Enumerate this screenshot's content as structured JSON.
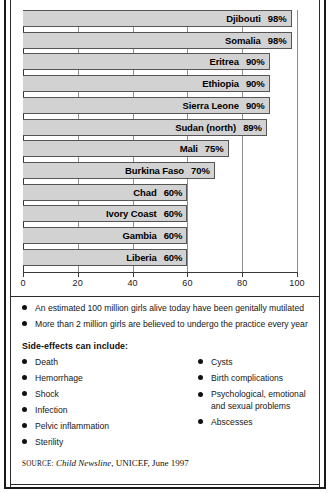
{
  "chart_data": {
    "type": "bar",
    "orientation": "horizontal",
    "title": "",
    "xlabel": "",
    "ylabel": "",
    "xlim": [
      0,
      100
    ],
    "grid": true,
    "value_suffix": "%",
    "tick_labels": [
      "0",
      "20",
      "40",
      "60",
      "80",
      "100"
    ],
    "tick_values": [
      0,
      20,
      40,
      60,
      80,
      100
    ],
    "categories": [
      "Djibouti",
      "Somalia",
      "Eritrea",
      "Ethiopia",
      "Sierra Leone",
      "Sudan (north)",
      "Mali",
      "Burkina Faso",
      "Chad",
      "Ivory Coast",
      "Gambia",
      "Liberia"
    ],
    "values": [
      98,
      98,
      90,
      90,
      90,
      89,
      75,
      70,
      60,
      60,
      60,
      60
    ],
    "value_labels": [
      "98%",
      "98%",
      "90%",
      "90%",
      "90%",
      "89%",
      "75%",
      "70%",
      "60%",
      "60%",
      "60%",
      "60%"
    ],
    "bar_fill": "#d2d2d2",
    "bar_border": "#555555"
  },
  "notes": [
    "An estimated 100 million girls alive today have been genitally mutilated",
    "More than 2 million girls are believed to undergo the practice every year"
  ],
  "side_effects": {
    "heading": "Side-effects can include:",
    "left": [
      "Death",
      "Hemorrhage",
      "Shock",
      "Infection",
      "Pelvic inflammation",
      "Sterility"
    ],
    "right": [
      "Cysts",
      "Birth complications",
      "Psychological, emotional",
      "Abscesses"
    ],
    "right_wrap_line": "and sexual problems"
  },
  "source": {
    "label": "SOURCE:",
    "publication": "Child Newsline",
    "rest": ", UNICEF, June 1997"
  }
}
